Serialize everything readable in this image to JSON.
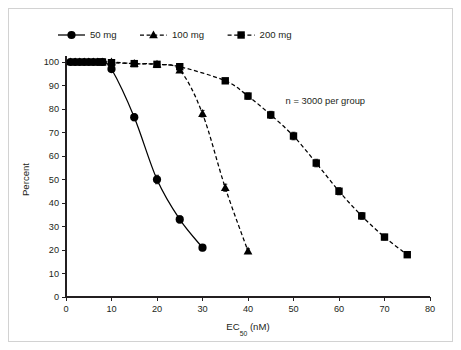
{
  "figure": {
    "background_color": "#ffffff",
    "frame_color": "#d2d2d2",
    "ink_color": "#231f20"
  },
  "annotation": {
    "text": "n = 3000 per group"
  },
  "axis": {
    "x_title_main": "EC",
    "x_title_sub": "50",
    "x_title_tail": " (nM)",
    "y_title": "Percent"
  },
  "legend": {
    "items": [
      {
        "label": "50 mg",
        "marker": "circle",
        "dash": "none"
      },
      {
        "label": "100 mg",
        "marker": "triangle",
        "dash": "dashed"
      },
      {
        "label": "200 mg",
        "marker": "square",
        "dash": "dashed"
      }
    ]
  },
  "chart_data": {
    "type": "line",
    "title": "",
    "subtitle": "",
    "xlabel": "EC50 (nM)",
    "ylabel": "Percent",
    "xlim": [
      0,
      80
    ],
    "ylim": [
      0,
      100
    ],
    "xticks": [
      0,
      10,
      20,
      30,
      40,
      50,
      60,
      70,
      80
    ],
    "yticks": [
      0,
      10,
      20,
      30,
      40,
      50,
      60,
      70,
      80,
      90,
      100
    ],
    "grid": false,
    "legend_position": "top-left",
    "annotations": [
      {
        "text": "n = 3000 per group",
        "x": 57,
        "y": 82
      }
    ],
    "series": [
      {
        "name": "50 mg",
        "marker": "circle",
        "linestyle": "solid",
        "color": "#000000",
        "x": [
          1,
          2,
          3,
          4,
          5,
          6,
          7,
          8,
          10,
          15,
          20,
          25,
          30
        ],
        "y": [
          100,
          100,
          100,
          100,
          100,
          100,
          100,
          100,
          97,
          76.5,
          50,
          33,
          21
        ],
        "yerr": [
          0,
          0,
          0,
          0,
          0,
          0,
          0,
          0,
          0.8,
          1.5,
          1.8,
          1.5,
          1.3
        ]
      },
      {
        "name": "100 mg",
        "marker": "triangle",
        "linestyle": "dashed",
        "color": "#000000",
        "x": [
          1,
          2,
          3,
          4,
          5,
          6,
          7,
          8,
          10,
          15,
          20,
          25,
          30,
          35,
          40
        ],
        "y": [
          100,
          100,
          100,
          100,
          100,
          100,
          100,
          100,
          100,
          99.3,
          99,
          96.5,
          78,
          46.5,
          19.5
        ],
        "yerr": [
          0,
          0,
          0,
          0,
          0,
          0,
          0,
          0,
          0,
          0.5,
          0.5,
          0.9,
          1.4,
          1.5,
          1.0
        ]
      },
      {
        "name": "200 mg",
        "marker": "square",
        "linestyle": "dashed",
        "color": "#000000",
        "x": [
          8,
          10,
          15,
          20,
          25,
          35,
          40,
          45,
          50,
          55,
          60,
          65,
          70,
          75
        ],
        "y": [
          100,
          99.7,
          99.3,
          99,
          98,
          92,
          85.5,
          77.5,
          68.5,
          57,
          45,
          34.5,
          25.5,
          18
        ],
        "yerr": [
          0,
          0,
          0,
          0,
          0.6,
          1.0,
          1.3,
          1.5,
          1.6,
          1.6,
          1.5,
          1.4,
          1.2,
          0.8
        ]
      }
    ]
  }
}
